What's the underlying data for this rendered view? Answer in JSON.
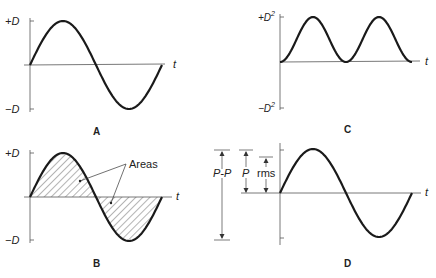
{
  "panels": {
    "A": {
      "label": "A",
      "y_top": "+D",
      "y_bottom": "−D",
      "x_axis": "t",
      "description": "sine wave, one full cycle"
    },
    "B": {
      "label": "B",
      "y_top": "+D",
      "y_bottom": "−D",
      "x_axis": "t",
      "annotation": "Areas",
      "description": "sine wave with hatched positive and negative areas"
    },
    "C": {
      "label": "C",
      "y_top": "+D",
      "y_top_sup": "2",
      "y_bottom": "−D",
      "y_bottom_sup": "2",
      "x_axis": "t",
      "description": "squared sine wave, two humps, all positive"
    },
    "D": {
      "label": "D",
      "x_axis": "t",
      "measures": {
        "peak_to_peak": "P-P",
        "peak": "P",
        "rms": "rms"
      },
      "description": "sine wave with peak-to-peak, peak and rms amplitude markers"
    }
  },
  "colors": {
    "curve": "#1a1a1a",
    "axis": "#555555",
    "hatch": "#444444",
    "text": "#222222"
  }
}
